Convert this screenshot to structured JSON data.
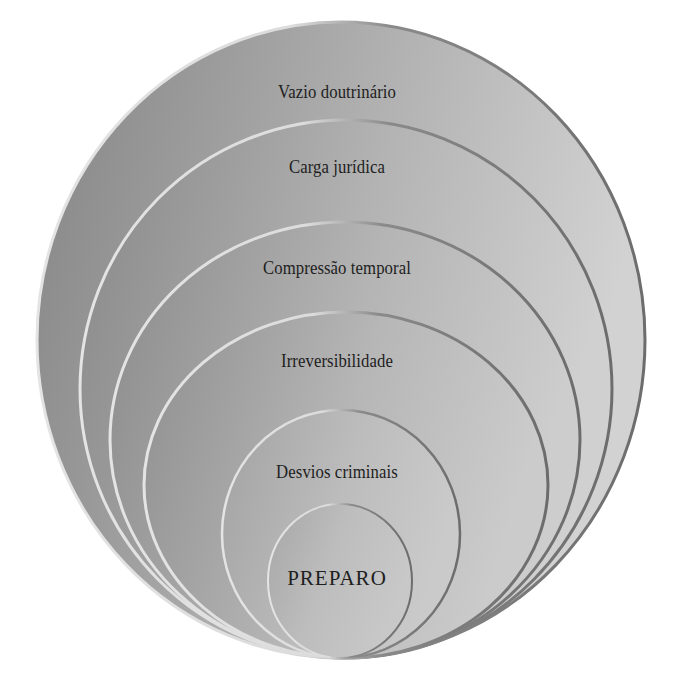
{
  "diagram": {
    "type": "nested-ellipses",
    "layers": [
      {
        "label": "Vazio doutrinário",
        "level": 1
      },
      {
        "label": "Carga jurídica",
        "level": 2
      },
      {
        "label": "Compressão temporal",
        "level": 3
      },
      {
        "label": "Irreversibilidade",
        "level": 4
      },
      {
        "label": "Desvios criminais",
        "level": 5
      },
      {
        "label": "PREPARO",
        "level": 6
      }
    ],
    "colors": {
      "fill_dark": "#8a8a8a",
      "fill_light": "#cfcfcf",
      "outline_highlight": "#e2e2e2",
      "outline_shadow": "#6e6e6e",
      "text": "#1e1e1e",
      "background": "#ffffff"
    }
  }
}
